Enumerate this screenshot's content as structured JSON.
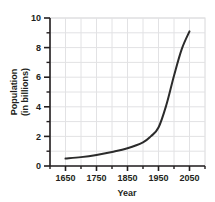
{
  "chart_data": {
    "type": "line",
    "title": "",
    "xlabel": "Year",
    "ylabel": "Population (in billions)",
    "ylabel_line1": "Population",
    "ylabel_line2": "(in billions)",
    "xlim": [
      1600,
      2100
    ],
    "ylim": [
      0,
      10
    ],
    "grid": true,
    "legend": "none",
    "x_tick_labels": [
      "1650",
      "1750",
      "1850",
      "1950",
      "2050"
    ],
    "x_tick_values": [
      1650,
      1750,
      1850,
      1950,
      2050
    ],
    "x_minor_tick_values": [
      1600,
      1700,
      1800,
      1900,
      2000,
      2100
    ],
    "y_tick_labels": [
      "0",
      "2",
      "4",
      "6",
      "8",
      "10"
    ],
    "y_tick_values": [
      0,
      2,
      4,
      6,
      8,
      10
    ],
    "y_minor_tick_values": [
      1,
      3,
      5,
      7,
      9
    ],
    "series": [
      {
        "name": "World population",
        "color": "#2b2b2b",
        "x": [
          1650,
          1700,
          1750,
          1800,
          1850,
          1900,
          1925,
          1950,
          1975,
          2000,
          2025,
          2050
        ],
        "values": [
          0.5,
          0.6,
          0.75,
          0.95,
          1.2,
          1.6,
          2.0,
          2.6,
          4.1,
          6.1,
          7.9,
          9.1
        ]
      }
    ]
  },
  "colors": {
    "line": "#2b2b2b",
    "axis": "#231f20",
    "grid": "#e2e2e4",
    "plot_border": "#d8d8da",
    "text": "#231f20",
    "background": "#ffffff"
  }
}
